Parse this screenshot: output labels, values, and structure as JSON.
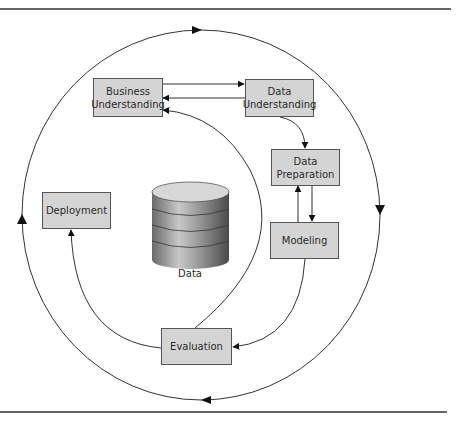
{
  "diagram": {
    "nodes": [
      {
        "id": "business",
        "label": "Business Understanding"
      },
      {
        "id": "data_understanding",
        "label": "Data Understanding"
      },
      {
        "id": "data_preparation",
        "label": "Data Preparation"
      },
      {
        "id": "modeling",
        "label": "Modeling"
      },
      {
        "id": "evaluation",
        "label": "Evaluation"
      },
      {
        "id": "deployment",
        "label": "Deployment"
      }
    ],
    "center": {
      "label": "Data",
      "icon": "database-cylinder-icon"
    },
    "edges": [
      {
        "from": "business",
        "to": "data_understanding"
      },
      {
        "from": "data_understanding",
        "to": "business"
      },
      {
        "from": "data_understanding",
        "to": "data_preparation"
      },
      {
        "from": "data_preparation",
        "to": "modeling"
      },
      {
        "from": "modeling",
        "to": "data_preparation"
      },
      {
        "from": "modeling",
        "to": "evaluation"
      },
      {
        "from": "evaluation",
        "to": "business"
      },
      {
        "from": "evaluation",
        "to": "deployment"
      }
    ],
    "outer_cycle": "clockwise",
    "colors": {
      "box_fill": "#d4d4d4",
      "box_border": "#555555",
      "line": "#333333"
    }
  }
}
